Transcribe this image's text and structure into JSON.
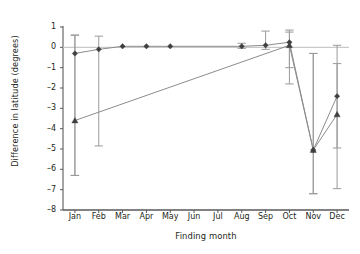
{
  "chart_data": {
    "type": "line",
    "title": "",
    "subtitle": "",
    "xlabel": "Finding month",
    "ylabel": "Difference in latitude (degrees)",
    "categories": [
      "Jan",
      "Feb",
      "Mar",
      "Apr",
      "May",
      "Jun",
      "Jul",
      "Aug",
      "Sep",
      "Oct",
      "Nov",
      "Dec"
    ],
    "ylim": [
      -8,
      1
    ],
    "yticks": [
      1,
      0,
      -1,
      -2,
      -3,
      -4,
      -5,
      -6,
      -7,
      -8
    ],
    "ytick_labels": [
      "1",
      "0",
      "–1",
      "–2",
      "–3",
      "–4",
      "–5",
      "–6",
      "–7",
      "–8"
    ],
    "grid": false,
    "legend": "none",
    "zero_reference_line": 0,
    "error_bars": true,
    "series": [
      {
        "name": "series-diamond",
        "marker": "diamond",
        "color": "#3f3f3f",
        "values": [
          -0.3,
          -0.1,
          0.05,
          0.05,
          0.05,
          null,
          null,
          0.05,
          0.1,
          0.25,
          -5.05,
          -2.4
        ],
        "err_low": [
          -6.3,
          -4.85,
          null,
          null,
          null,
          null,
          null,
          null,
          null,
          -1.8,
          -7.2,
          -6.95
        ],
        "err_high": [
          0.6,
          0.55,
          null,
          null,
          null,
          null,
          null,
          null,
          null,
          0.75,
          -0.3,
          0.1
        ]
      },
      {
        "name": "series-triangle",
        "marker": "triangle",
        "color": "#3f3f3f",
        "values": [
          -3.6,
          null,
          null,
          null,
          null,
          null,
          null,
          null,
          null,
          0.1,
          -5.05,
          -3.3
        ],
        "err_low": [
          -6.3,
          null,
          null,
          null,
          null,
          null,
          null,
          null,
          null,
          -1.0,
          -7.2,
          -4.95
        ],
        "err_high": [
          0.6,
          null,
          null,
          null,
          null,
          null,
          null,
          null,
          null,
          0.85,
          -0.3,
          -0.8
        ]
      }
    ],
    "extra_error_bars": [
      {
        "category": "Sep",
        "value": 0.1,
        "low": -0.1,
        "high": 0.8
      },
      {
        "category": "Aug",
        "value": 0.05,
        "low": -0.05,
        "high": 0.2
      }
    ],
    "colors": {
      "axis": "#58595b",
      "line": "#8c8c8c",
      "marker": "#3f3f3f",
      "errorbar": "#9a9a9a",
      "background": "#ffffff",
      "text": "#231f20"
    }
  }
}
